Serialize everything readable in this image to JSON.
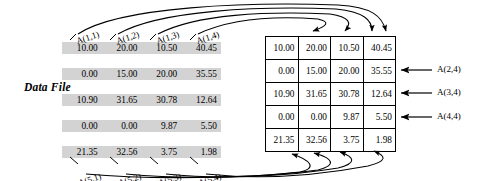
{
  "diagram": {
    "datafile_label": "Data File",
    "columns": 4,
    "rows": [
      [
        "10.00",
        "20.00",
        "10.50",
        "40.45"
      ],
      [
        "0.00",
        "15.00",
        "20.00",
        "35.55"
      ],
      [
        "10.90",
        "31.65",
        "30.78",
        "12.64"
      ],
      [
        "0.00",
        "0.00",
        "9.87",
        "5.50"
      ],
      [
        "21.35",
        "32.56",
        "3.75",
        "1.98"
      ]
    ],
    "top_labels": [
      "A(1,1)",
      "A(1,2)",
      "A(1,3)",
      "A(1,4)"
    ],
    "bottom_labels": [
      "A(5,1)",
      "A(5,2)",
      "A(5,3)",
      "A(5,4)"
    ],
    "right_labels": [
      "A(2,4)",
      "A(3,4)",
      "A(4,4)"
    ],
    "colors": {
      "row_shade": "#d3d3d3",
      "rule": "#000000",
      "background": "#ffffff"
    }
  }
}
